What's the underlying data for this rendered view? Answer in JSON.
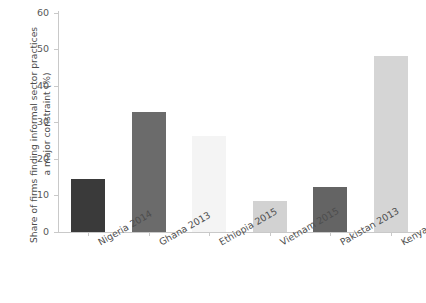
{
  "chart_data": {
    "type": "bar",
    "title": "",
    "subtitle": "",
    "xlabel": "",
    "ylabel": "Share of firms finding informal sector practices a major constraint (%)",
    "ylabel_lines": [
      "Share of firms finding informal sector practices",
      "a major constraint (%)"
    ],
    "categories": [
      "Nigeria 2014",
      "Ghana 2013",
      "Ethiopia 2015",
      "Vietnam 2015",
      "Pakistan 2013",
      "Kenya 2018"
    ],
    "values": [
      14.5,
      32.9,
      26.2,
      8.5,
      12.2,
      48.2
    ],
    "bar_colors": [
      "#3a3a3a",
      "#6b6b6b",
      "#f4f4f4",
      "#d2d2d2",
      "#646464",
      "#d5d5d5"
    ],
    "ylim": [
      0,
      60
    ],
    "yticks": [
      0,
      10,
      20,
      30,
      40,
      50,
      60
    ],
    "ytick_labels": [
      "0",
      "10",
      "20",
      "30",
      "40",
      "50",
      "60"
    ],
    "grid": false,
    "legend": false,
    "legend_position": "none",
    "axis_color": "#c9c9c9",
    "text_color": "#4d4d4d"
  }
}
